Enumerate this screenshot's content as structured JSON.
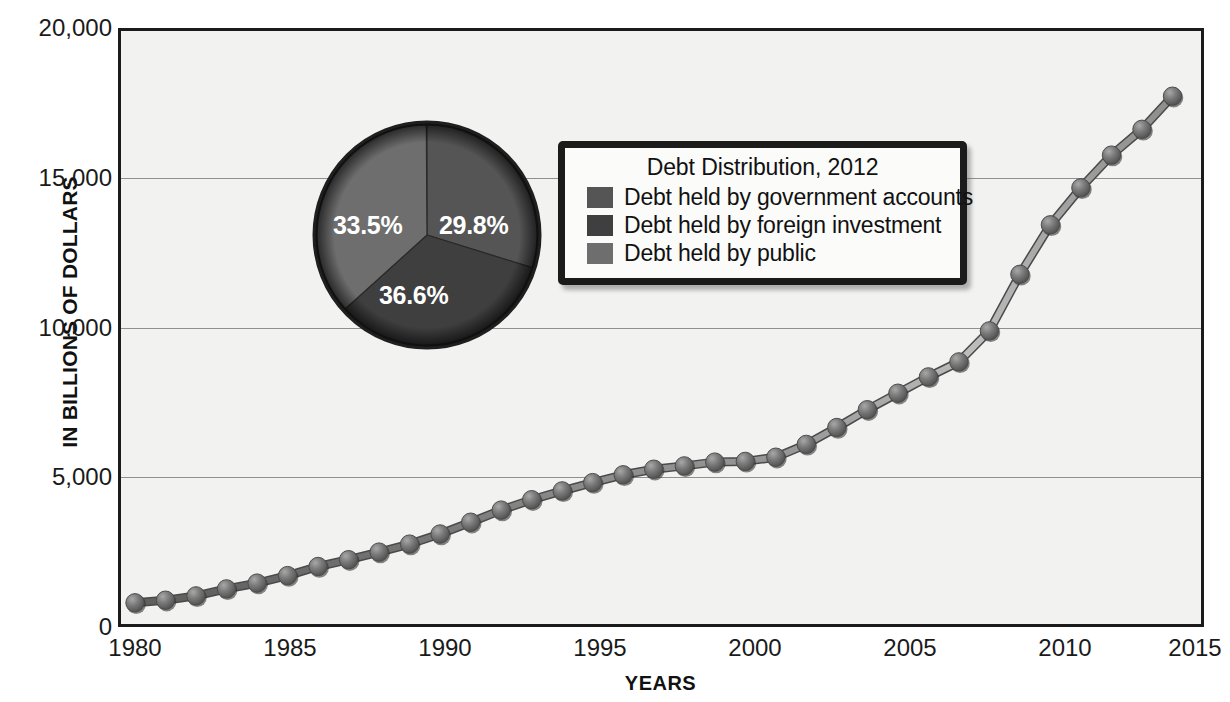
{
  "chart_data": {
    "type": "line",
    "title": "",
    "xlabel": "YEARS",
    "ylabel": "IN BILLIONS OF DOLLARS",
    "xlim": [
      1980,
      2015
    ],
    "ylim": [
      0,
      20000
    ],
    "grid": true,
    "y_ticks": [
      "20,000",
      "15,000",
      "10,000",
      "5,000",
      "0"
    ],
    "y_tick_values": [
      20000,
      15000,
      10000,
      5000,
      0
    ],
    "x_ticks": [
      "1980",
      "1985",
      "1990",
      "1995",
      "2000",
      "2005",
      "2010",
      "2015"
    ],
    "x_tick_values": [
      1980,
      1985,
      1990,
      1995,
      2000,
      2005,
      2010,
      2015
    ],
    "series": [
      {
        "name": "Total public debt",
        "marker": "sphere",
        "color": "#6b6b6b",
        "x": [
          1980,
          1981,
          1982,
          1983,
          1984,
          1985,
          1986,
          1987,
          1988,
          1989,
          1990,
          1991,
          1992,
          1993,
          1994,
          1995,
          1996,
          1997,
          1998,
          1999,
          2000,
          2001,
          2002,
          2003,
          2004,
          2005,
          2006,
          2007,
          2008,
          2009,
          2010,
          2011,
          2012,
          2013,
          2014
        ],
        "values": [
          909,
          995,
          1137,
          1372,
          1565,
          1818,
          2121,
          2346,
          2601,
          2868,
          3206,
          3598,
          4002,
          4351,
          4644,
          4921,
          5182,
          5369,
          5478,
          5606,
          5629,
          5770,
          6198,
          6760,
          7355,
          7905,
          8451,
          8951,
          9986,
          11876,
          13529,
          14764,
          15856,
          16719,
          17824
        ]
      }
    ],
    "annotations": {
      "pie": {
        "title": "Debt Distribution, 2012",
        "slices": [
          {
            "label": "Debt held by government accounts",
            "percent": 29.8,
            "display": "29.8%",
            "color": "#555555"
          },
          {
            "label": "Debt held by foreign investment",
            "percent": 33.5,
            "display": "33.5%",
            "color": "#3f3f3f"
          },
          {
            "label": "Debt held by public",
            "percent": 36.6,
            "display": "36.6%",
            "color": "#6e6e6e"
          }
        ]
      }
    }
  },
  "legend": {
    "title": "Debt Distribution, 2012",
    "items": [
      {
        "label": "Debt held by government accounts",
        "color": "#555555"
      },
      {
        "label": "Debt held by foreign investment",
        "color": "#3f3f3f"
      },
      {
        "label": "Debt held by public",
        "color": "#6e6e6e"
      }
    ]
  },
  "pie_labels": [
    {
      "text": "29.8%"
    },
    {
      "text": "33.5%"
    },
    {
      "text": "36.6%"
    }
  ]
}
